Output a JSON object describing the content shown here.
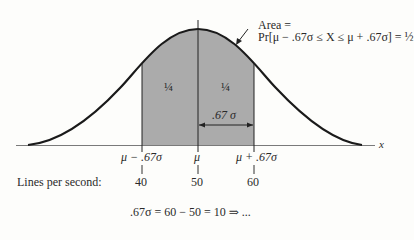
{
  "diagram": {
    "type": "normal-distribution-curve",
    "axis_label": "x",
    "annotation": {
      "line1": "Area =",
      "line2": "Pr[μ − .67σ ≤ X ≤ μ + .67σ] = ½"
    },
    "regions": [
      {
        "label": "¼"
      },
      {
        "label": "¼"
      }
    ],
    "width_label": ".67 σ",
    "ticks": [
      {
        "symbol": "μ − .67σ",
        "value": "40"
      },
      {
        "symbol": "μ",
        "value": "50"
      },
      {
        "symbol": "μ + .67σ",
        "value": "60"
      }
    ],
    "row_label": "Lines per second:",
    "caption_partial": ".67σ = 60 − 50 = 10 ⇒ ..."
  },
  "colors": {
    "shade": "#aaaaaa",
    "curve": "#1a1a1a",
    "axis": "#7a7a7a",
    "background": "#fdfdfb"
  }
}
